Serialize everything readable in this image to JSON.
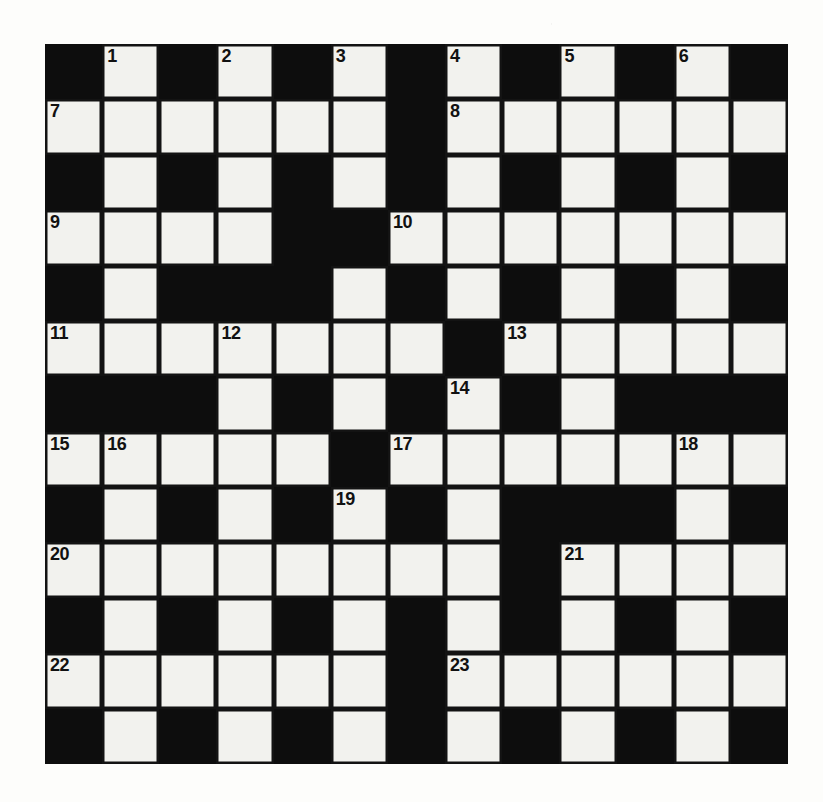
{
  "puzzle": {
    "title": "Crossword Grid",
    "rows": 13,
    "columns": 13,
    "colors": {
      "block": "#0d0d0d",
      "cell": "#f2f2ee",
      "paper": "#fdfdfb",
      "number_text": "#111111"
    },
    "grid": [
      [
        "black",
        "white",
        "black",
        "white",
        "black",
        "white",
        "black",
        "white",
        "black",
        "white",
        "black",
        "white",
        "black"
      ],
      [
        "white",
        "white",
        "white",
        "white",
        "white",
        "white",
        "black",
        "white",
        "white",
        "white",
        "white",
        "white",
        "white"
      ],
      [
        "black",
        "white",
        "black",
        "white",
        "black",
        "white",
        "black",
        "white",
        "black",
        "white",
        "black",
        "white",
        "black"
      ],
      [
        "white",
        "white",
        "white",
        "white",
        "black",
        "black",
        "white",
        "white",
        "white",
        "white",
        "white",
        "white",
        "white"
      ],
      [
        "black",
        "white",
        "black",
        "black",
        "black",
        "white",
        "black",
        "white",
        "black",
        "white",
        "black",
        "white",
        "black"
      ],
      [
        "white",
        "white",
        "white",
        "white",
        "white",
        "white",
        "white",
        "black",
        "white",
        "white",
        "white",
        "white",
        "white"
      ],
      [
        "black",
        "black",
        "black",
        "white",
        "black",
        "white",
        "black",
        "white",
        "black",
        "white",
        "black",
        "black",
        "black"
      ],
      [
        "white",
        "white",
        "white",
        "white",
        "white",
        "black",
        "white",
        "white",
        "white",
        "white",
        "white",
        "white",
        "white"
      ],
      [
        "black",
        "white",
        "black",
        "white",
        "black",
        "white",
        "black",
        "white",
        "black",
        "black",
        "black",
        "white",
        "black"
      ],
      [
        "white",
        "white",
        "white",
        "white",
        "white",
        "white",
        "white",
        "white",
        "black",
        "white",
        "white",
        "white",
        "white"
      ],
      [
        "black",
        "white",
        "black",
        "white",
        "black",
        "white",
        "black",
        "white",
        "black",
        "white",
        "black",
        "white",
        "black"
      ],
      [
        "white",
        "white",
        "white",
        "white",
        "white",
        "white",
        "black",
        "white",
        "white",
        "white",
        "white",
        "white",
        "white"
      ],
      [
        "black",
        "white",
        "black",
        "white",
        "black",
        "white",
        "black",
        "white",
        "black",
        "white",
        "black",
        "white",
        "black"
      ]
    ],
    "numbers": [
      {
        "row": 0,
        "col": 1,
        "label": "1"
      },
      {
        "row": 0,
        "col": 3,
        "label": "2"
      },
      {
        "row": 0,
        "col": 5,
        "label": "3"
      },
      {
        "row": 0,
        "col": 7,
        "label": "4"
      },
      {
        "row": 0,
        "col": 9,
        "label": "5"
      },
      {
        "row": 0,
        "col": 11,
        "label": "6"
      },
      {
        "row": 1,
        "col": 0,
        "label": "7"
      },
      {
        "row": 1,
        "col": 7,
        "label": "8"
      },
      {
        "row": 3,
        "col": 0,
        "label": "9"
      },
      {
        "row": 3,
        "col": 6,
        "label": "10"
      },
      {
        "row": 5,
        "col": 0,
        "label": "11"
      },
      {
        "row": 5,
        "col": 3,
        "label": "12"
      },
      {
        "row": 5,
        "col": 8,
        "label": "13"
      },
      {
        "row": 6,
        "col": 7,
        "label": "14"
      },
      {
        "row": 7,
        "col": 0,
        "label": "15"
      },
      {
        "row": 7,
        "col": 1,
        "label": "16"
      },
      {
        "row": 7,
        "col": 6,
        "label": "17"
      },
      {
        "row": 7,
        "col": 11,
        "label": "18"
      },
      {
        "row": 8,
        "col": 5,
        "label": "19"
      },
      {
        "row": 9,
        "col": 0,
        "label": "20"
      },
      {
        "row": 9,
        "col": 9,
        "label": "21"
      },
      {
        "row": 11,
        "col": 0,
        "label": "22"
      },
      {
        "row": 11,
        "col": 7,
        "label": "23"
      }
    ],
    "letters": []
  }
}
